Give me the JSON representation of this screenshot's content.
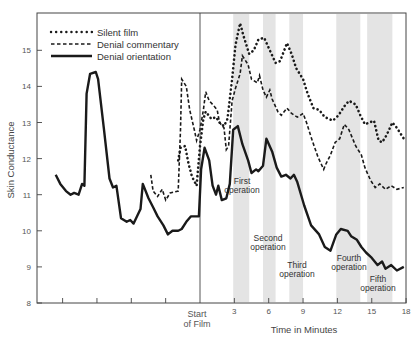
{
  "chart_data": {
    "type": "line",
    "title": "",
    "xlabel": "Time in Minutes",
    "ylabel": "Skin Conductance",
    "ylim": [
      8,
      16
    ],
    "xlim": [
      -14.2,
      18
    ],
    "y_ticks": [
      8,
      9,
      10,
      11,
      12,
      13,
      14,
      15
    ],
    "x_ticks": [
      {
        "t": -12,
        "label": ""
      },
      {
        "t": -9,
        "label": ""
      },
      {
        "t": -6,
        "label": ""
      },
      {
        "t": -3,
        "label": ""
      },
      {
        "t": 0,
        "label": "Start of Film"
      },
      {
        "t": 3,
        "label": "3"
      },
      {
        "t": 6,
        "label": "6"
      },
      {
        "t": 9,
        "label": "9"
      },
      {
        "t": 12,
        "label": "12"
      },
      {
        "t": 15,
        "label": "15"
      },
      {
        "t": 18,
        "label": "18"
      }
    ],
    "start_marker": {
      "t": 0,
      "label_line1": "Start",
      "label_line2": "of Film"
    },
    "grid": false,
    "legend_position": "top-left",
    "shaded_intervals": [
      {
        "label_line1": "First",
        "label_line2": "operation",
        "start": 2.9,
        "end": 4.3
      },
      {
        "label_line1": "Second",
        "label_line2": "operation",
        "start": 5.5,
        "end": 6.6
      },
      {
        "label_line1": "Third",
        "label_line2": "operation",
        "start": 7.8,
        "end": 9.0
      },
      {
        "label_line1": "Fourth",
        "label_line2": "operation",
        "start": 11.9,
        "end": 14.0
      },
      {
        "label_line1": "Fifth",
        "label_line2": "operation",
        "start": 14.6,
        "end": 16.8
      }
    ],
    "series": [
      {
        "name": "Silent film",
        "style": "dotted",
        "points": [
          [
            -1.9,
            11.95
          ],
          [
            -1.7,
            12.3
          ],
          [
            -1.3,
            12.35
          ],
          [
            -1.0,
            11.85
          ],
          [
            -0.7,
            11.5
          ],
          [
            -0.3,
            11.25
          ],
          [
            0.0,
            12.35
          ],
          [
            0.3,
            13.1
          ],
          [
            0.5,
            13.3
          ],
          [
            1.0,
            13.1
          ],
          [
            1.4,
            13.15
          ],
          [
            1.7,
            13.0
          ],
          [
            2.1,
            12.9
          ],
          [
            2.4,
            13.1
          ],
          [
            2.8,
            14.2
          ],
          [
            3.1,
            15.15
          ],
          [
            3.5,
            15.75
          ],
          [
            3.8,
            15.4
          ],
          [
            4.3,
            14.9
          ],
          [
            4.7,
            15.0
          ],
          [
            5.1,
            15.3
          ],
          [
            5.6,
            15.35
          ],
          [
            6.1,
            15.0
          ],
          [
            6.6,
            14.65
          ],
          [
            7.0,
            14.7
          ],
          [
            7.6,
            15.2
          ],
          [
            8.0,
            14.9
          ],
          [
            8.4,
            14.5
          ],
          [
            9.0,
            14.2
          ],
          [
            9.4,
            13.8
          ],
          [
            9.9,
            13.4
          ],
          [
            10.4,
            13.35
          ],
          [
            10.9,
            13.15
          ],
          [
            11.6,
            13.05
          ],
          [
            12.1,
            13.2
          ],
          [
            12.6,
            13.45
          ],
          [
            13.0,
            13.6
          ],
          [
            13.6,
            13.5
          ],
          [
            14.0,
            13.2
          ],
          [
            14.4,
            12.95
          ],
          [
            14.8,
            13.0
          ],
          [
            15.2,
            13.05
          ],
          [
            15.6,
            12.5
          ],
          [
            15.9,
            12.45
          ],
          [
            16.3,
            12.65
          ],
          [
            16.8,
            13.0
          ],
          [
            17.2,
            12.85
          ],
          [
            17.6,
            12.65
          ],
          [
            17.9,
            12.5
          ]
        ]
      },
      {
        "name": "Denial commentary",
        "style": "dashed",
        "points": [
          [
            -4.3,
            11.55
          ],
          [
            -4.1,
            11.1
          ],
          [
            -3.7,
            10.95
          ],
          [
            -3.3,
            11.15
          ],
          [
            -3.0,
            10.85
          ],
          [
            -2.6,
            11.05
          ],
          [
            -1.9,
            11.1
          ],
          [
            -1.7,
            12.8
          ],
          [
            -1.6,
            14.2
          ],
          [
            -1.2,
            14.0
          ],
          [
            -0.9,
            13.35
          ],
          [
            -0.5,
            12.8
          ],
          [
            -0.3,
            12.5
          ],
          [
            0.0,
            12.8
          ],
          [
            0.3,
            13.35
          ],
          [
            0.5,
            13.85
          ],
          [
            0.8,
            13.6
          ],
          [
            1.1,
            13.5
          ],
          [
            1.5,
            13.35
          ],
          [
            1.7,
            13.0
          ],
          [
            2.1,
            12.85
          ],
          [
            2.3,
            12.25
          ],
          [
            2.5,
            12.35
          ],
          [
            2.8,
            13.6
          ],
          [
            3.1,
            13.95
          ],
          [
            3.5,
            14.35
          ],
          [
            3.7,
            14.85
          ],
          [
            4.2,
            14.6
          ],
          [
            4.5,
            14.2
          ],
          [
            5.0,
            14.1
          ],
          [
            5.2,
            14.3
          ],
          [
            5.5,
            13.9
          ],
          [
            5.8,
            13.7
          ],
          [
            6.1,
            13.9
          ],
          [
            6.3,
            13.65
          ],
          [
            6.8,
            13.3
          ],
          [
            7.1,
            13.2
          ],
          [
            7.6,
            13.4
          ],
          [
            8.0,
            13.25
          ],
          [
            8.5,
            13.15
          ],
          [
            9.0,
            13.25
          ],
          [
            9.3,
            13.0
          ],
          [
            9.8,
            12.5
          ],
          [
            10.3,
            12.05
          ],
          [
            10.8,
            11.7
          ],
          [
            11.0,
            11.85
          ],
          [
            11.4,
            12.1
          ],
          [
            11.8,
            12.45
          ],
          [
            12.2,
            12.55
          ],
          [
            12.6,
            12.95
          ],
          [
            13.0,
            12.8
          ],
          [
            13.6,
            12.35
          ],
          [
            14.1,
            12.1
          ],
          [
            14.4,
            11.75
          ],
          [
            14.9,
            11.4
          ],
          [
            15.3,
            11.2
          ],
          [
            15.7,
            11.3
          ],
          [
            16.2,
            11.15
          ],
          [
            16.7,
            11.25
          ],
          [
            17.2,
            11.15
          ],
          [
            17.8,
            11.2
          ]
        ]
      },
      {
        "name": "Denial orientation",
        "style": "solid",
        "points": [
          [
            -12.6,
            11.55
          ],
          [
            -12.2,
            11.3
          ],
          [
            -11.7,
            11.1
          ],
          [
            -11.3,
            11.0
          ],
          [
            -11.0,
            11.05
          ],
          [
            -10.6,
            11.0
          ],
          [
            -10.3,
            11.3
          ],
          [
            -10.1,
            11.25
          ],
          [
            -9.9,
            13.8
          ],
          [
            -9.6,
            14.35
          ],
          [
            -9.1,
            14.4
          ],
          [
            -8.9,
            14.2
          ],
          [
            -8.4,
            12.85
          ],
          [
            -7.9,
            11.45
          ],
          [
            -7.6,
            11.2
          ],
          [
            -7.3,
            11.25
          ],
          [
            -6.9,
            10.35
          ],
          [
            -6.4,
            10.25
          ],
          [
            -6.1,
            10.3
          ],
          [
            -5.8,
            10.2
          ],
          [
            -5.2,
            10.6
          ],
          [
            -5.0,
            11.3
          ],
          [
            -4.5,
            10.9
          ],
          [
            -4.1,
            10.65
          ],
          [
            -3.7,
            10.4
          ],
          [
            -3.2,
            10.15
          ],
          [
            -2.8,
            9.9
          ],
          [
            -2.4,
            10.0
          ],
          [
            -1.9,
            10.0
          ],
          [
            -1.6,
            10.05
          ],
          [
            -1.2,
            10.25
          ],
          [
            -0.8,
            10.4
          ],
          [
            -0.1,
            10.4
          ],
          [
            0.1,
            11.7
          ],
          [
            0.4,
            12.3
          ],
          [
            0.8,
            11.95
          ],
          [
            1.1,
            11.25
          ],
          [
            1.4,
            11.0
          ],
          [
            1.6,
            11.25
          ],
          [
            1.9,
            10.85
          ],
          [
            2.3,
            10.9
          ],
          [
            2.6,
            11.3
          ],
          [
            2.9,
            12.8
          ],
          [
            3.3,
            12.9
          ],
          [
            3.7,
            12.4
          ],
          [
            4.2,
            11.95
          ],
          [
            4.5,
            11.6
          ],
          [
            4.9,
            11.7
          ],
          [
            5.1,
            11.65
          ],
          [
            5.5,
            11.8
          ],
          [
            5.8,
            12.55
          ],
          [
            6.3,
            12.2
          ],
          [
            6.7,
            11.75
          ],
          [
            7.1,
            11.5
          ],
          [
            7.5,
            11.55
          ],
          [
            7.9,
            11.45
          ],
          [
            8.2,
            11.55
          ],
          [
            8.5,
            11.35
          ],
          [
            9.1,
            10.7
          ],
          [
            9.7,
            10.15
          ],
          [
            10.4,
            9.9
          ],
          [
            10.9,
            9.55
          ],
          [
            11.4,
            9.45
          ],
          [
            11.9,
            9.9
          ],
          [
            12.3,
            10.05
          ],
          [
            12.9,
            10.0
          ],
          [
            13.2,
            9.85
          ],
          [
            13.7,
            9.75
          ],
          [
            14.1,
            9.55
          ],
          [
            14.5,
            9.4
          ],
          [
            15.0,
            9.25
          ],
          [
            15.5,
            9.05
          ],
          [
            15.9,
            9.15
          ],
          [
            16.2,
            8.95
          ],
          [
            16.7,
            9.05
          ],
          [
            17.2,
            8.9
          ],
          [
            17.8,
            9.0
          ]
        ]
      }
    ]
  },
  "legend": {
    "items": [
      {
        "label": "Silent film",
        "style": "dotted"
      },
      {
        "label": "Denial commentary",
        "style": "dashed"
      },
      {
        "label": "Denial orientation",
        "style": "solid"
      }
    ]
  },
  "axes": {
    "y_title": "Skin Conductance",
    "x_title": "Time in Minutes",
    "start_label_1": "Start",
    "start_label_2": "of Film"
  },
  "colors": {
    "line": "#1a1a1a",
    "shade": "#e4e4e4",
    "frame": "#444444"
  }
}
